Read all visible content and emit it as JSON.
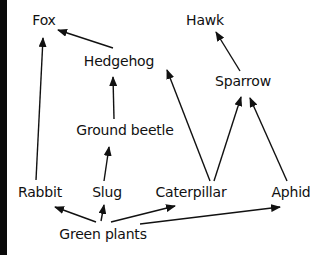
{
  "diagram": {
    "type": "food-web",
    "colors": {
      "text": "#111111",
      "arrow": "#111111",
      "border": "#0a0a0a",
      "background": "#ffffff"
    },
    "nodes": [
      {
        "id": "fox",
        "label": "Fox",
        "x": 44,
        "y": 20
      },
      {
        "id": "hawk",
        "label": "Hawk",
        "x": 205,
        "y": 20
      },
      {
        "id": "hedgehog",
        "label": "Hedgehog",
        "x": 119,
        "y": 61
      },
      {
        "id": "sparrow",
        "label": "Sparrow",
        "x": 243,
        "y": 81
      },
      {
        "id": "ground_beetle",
        "label": "Ground beetle",
        "x": 125,
        "y": 130
      },
      {
        "id": "rabbit",
        "label": "Rabbit",
        "x": 40,
        "y": 192
      },
      {
        "id": "slug",
        "label": "Slug",
        "x": 107,
        "y": 192
      },
      {
        "id": "caterpillar",
        "label": "Caterpillar",
        "x": 191,
        "y": 192
      },
      {
        "id": "aphid",
        "label": "Aphid",
        "x": 291,
        "y": 192
      },
      {
        "id": "green_plants",
        "label": "Green plants",
        "x": 103,
        "y": 234
      }
    ],
    "edges": [
      {
        "from": "hedgehog",
        "to": "fox",
        "x1": 113,
        "y1": 48,
        "x2": 58,
        "y2": 30
      },
      {
        "from": "rabbit",
        "to": "fox",
        "x1": 36,
        "y1": 180,
        "x2": 43,
        "y2": 38
      },
      {
        "from": "ground_beetle",
        "to": "hedgehog",
        "x1": 114,
        "y1": 119,
        "x2": 113,
        "y2": 77
      },
      {
        "from": "sparrow",
        "to": "hawk",
        "x1": 240,
        "y1": 71,
        "x2": 216,
        "y2": 32
      },
      {
        "from": "caterpillar",
        "to": "hedgehog",
        "x1": 210,
        "y1": 181,
        "x2": 167,
        "y2": 70
      },
      {
        "from": "caterpillar",
        "to": "sparrow",
        "x1": 214,
        "y1": 181,
        "x2": 241,
        "y2": 97
      },
      {
        "from": "aphid",
        "to": "sparrow",
        "x1": 287,
        "y1": 181,
        "x2": 250,
        "y2": 98
      },
      {
        "from": "slug",
        "to": "ground_beetle",
        "x1": 104,
        "y1": 181,
        "x2": 109,
        "y2": 147
      },
      {
        "from": "green_plants",
        "to": "rabbit",
        "x1": 96,
        "y1": 222,
        "x2": 55,
        "y2": 207
      },
      {
        "from": "green_plants",
        "to": "slug",
        "x1": 101,
        "y1": 221,
        "x2": 104,
        "y2": 205
      },
      {
        "from": "green_plants",
        "to": "caterpillar",
        "x1": 111,
        "y1": 222,
        "x2": 175,
        "y2": 206
      },
      {
        "from": "green_plants",
        "to": "aphid",
        "x1": 140,
        "y1": 224,
        "x2": 280,
        "y2": 207
      }
    ]
  }
}
